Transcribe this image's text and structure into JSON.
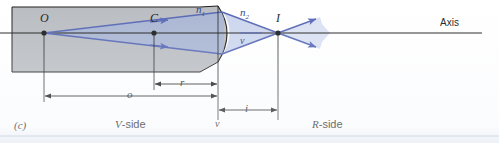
{
  "figure": {
    "panel_label": "(c)",
    "axis_label": "Axis",
    "v_side_label": "V-side",
    "r_side_label": "R-side",
    "vertex_label": "v",
    "vertex_label_bottom": "v",
    "points": [
      {
        "name": "object-point",
        "label": "O",
        "x": 44,
        "y": 33
      },
      {
        "name": "center-of-curvature",
        "label": "C",
        "x": 154,
        "y": 33
      },
      {
        "name": "image-point",
        "label": "I",
        "x": 278,
        "y": 33
      }
    ],
    "media": [
      {
        "name": "n1",
        "label": "n",
        "subscript": "1",
        "x": 198,
        "y": 8
      },
      {
        "name": "n2",
        "label": "n",
        "subscript": "2",
        "x": 241,
        "y": 11
      }
    ],
    "dimensions": [
      {
        "name": "radius",
        "label": "r",
        "from_x": 154,
        "to_x": 218,
        "y": 84
      },
      {
        "name": "object-distance",
        "label": "o",
        "from_x": 44,
        "to_x": 218,
        "y": 96
      },
      {
        "name": "image-distance",
        "label": "i",
        "from_x": 218,
        "to_x": 278,
        "y": 110
      }
    ],
    "colors": {
      "medium_gray": "#b9bcc0",
      "ray_blue": "#5566b4",
      "ray_fill": "#aab7de",
      "line_black": "#1a1a1a",
      "label_blue": "#2b3f8c"
    },
    "geometry": {
      "axis_y": 33,
      "block_left": 12,
      "block_top": 7,
      "block_bottom": 72,
      "vertex_x": 218,
      "surface_top_y": 6,
      "surface_bottom_y": 62
    }
  }
}
